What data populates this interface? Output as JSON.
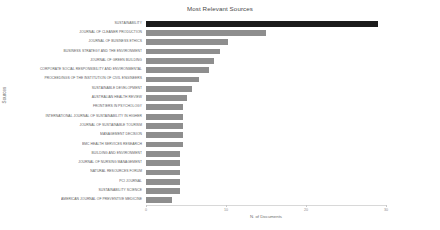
{
  "chart_data": {
    "type": "bar",
    "orientation": "horizontal",
    "title": "Most Relevant Sources",
    "xlabel": "N. of Documents",
    "ylabel": "Sources",
    "xlim": [
      0,
      30
    ],
    "xticks": [
      0,
      10,
      20,
      30
    ],
    "grid": false,
    "legend": null,
    "categories": [
      "SUSTAINABILITY",
      "JOURNAL OF CLEANER PRODUCTION",
      "JOURNAL OF BUSINESS ETHICS",
      "BUSINESS STRATEGY AND THE ENVIRONMENT",
      "JOURNAL OF GREEN BUILDING",
      "CORPORATE SOCIAL RESPONSIBILITY AND ENVIRONMENTAL",
      "PROCEEDINGS OF THE INSTITUTION OF CIVIL ENGINEERS",
      "SUSTAINABLE DEVELOPMENT",
      "AUSTRALIAN HEALTH REVIEW",
      "FRONTIERS IN PSYCHOLOGY",
      "INTERNATIONAL JOURNAL OF SUSTAINABILITY IN HIGHER",
      "JOURNAL OF SUSTAINABLE TOURISM",
      "MANAGEMENT DECISION",
      "BMC HEALTH SERVICES RESEARCH",
      "BUILDING AND ENVIRONMENT",
      "JOURNAL OF NURSING MANAGEMENT",
      "NATURAL RESOURCES FORUM",
      "PCI JOURNAL",
      "SUSTAINABILITY SCIENCE",
      "AMERICAN JOURNAL OF PREVENTIVE MEDICINE"
    ],
    "values": [
      29,
      15,
      10.3,
      9.2,
      8.5,
      7.9,
      6.6,
      5.7,
      5.1,
      4.6,
      4.6,
      4.6,
      4.6,
      4.6,
      4.2,
      4.2,
      4.2,
      4.2,
      4.2,
      3.2
    ],
    "bar_colors": {
      "highlight": "#1b1b1b",
      "default": "#8e8e8e"
    }
  }
}
